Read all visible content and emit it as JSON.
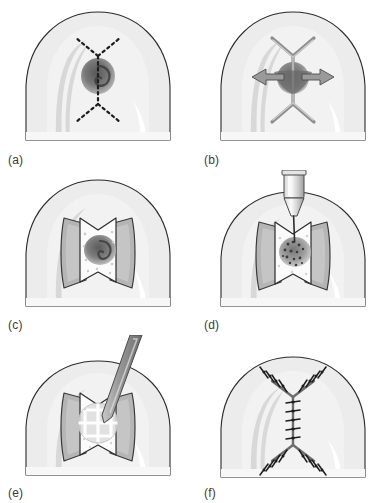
{
  "figure": {
    "type": "surgical-procedure-illustration",
    "style": "grayscale line drawing",
    "background_color": "#ffffff",
    "columns": 2,
    "rows": 3,
    "panel_count": 6
  },
  "palette": {
    "outline": "#2b2b2b",
    "skin_base": "#ececec",
    "skin_light": "#f4f4f4",
    "skin_mid": "#e0e0e0",
    "skin_shadow": "#d2d2d2",
    "highlight": "#ffffff",
    "lesion_dark": "#6e6e6e",
    "lesion_core": "#4a4a4a",
    "flap_underside": "#b9b9b9",
    "flap_face": "#fbfbfb",
    "instrument_light": "#e6e6e6",
    "instrument_mid": "#bdbdbd",
    "instrument_dark": "#8a8a8a",
    "suture": "#1d1d1d",
    "label_text": "#3a3a3a"
  },
  "panels": [
    {
      "id": "a",
      "label": "(a)",
      "caption_text": "(a)",
      "stage": "planned-incision",
      "description": "Dome shaped anatomical structure with a pigmented lesion at center and a dashed double-Y (lazy-H) incision marked over it",
      "markings": {
        "incision_style": "dashed",
        "incision_pattern": "double-Y",
        "lesion_visible": true,
        "instrument": "none"
      }
    },
    {
      "id": "b",
      "label": "(b)",
      "caption_text": "(b)",
      "stage": "incision-made-and-undermining",
      "description": "The double-Y incision has been cut and bidirectional arrows show lateral undermining of the tissue",
      "markings": {
        "incision_style": "solid-cut",
        "incision_pattern": "double-Y",
        "lesion_visible": true,
        "instrument": "arrows",
        "arrow_count": 2,
        "arrow_direction": "bidirectional-lateral"
      }
    },
    {
      "id": "c",
      "label": "(c)",
      "caption_text": "(c)",
      "stage": "flaps-retracted",
      "description": "Two triangular flaps are raised and retracted laterally exposing the lesion on the underlying surface",
      "markings": {
        "incision_style": "open",
        "incision_pattern": "double-Y",
        "lesion_visible": true,
        "instrument": "none",
        "flaps_raised": 2
      }
    },
    {
      "id": "d",
      "label": "(d)",
      "caption_text": "(d)",
      "stage": "injection-application",
      "description": "A syringe or applicator tip delivers a speckled agent onto the exposed lesion between the retracted flaps",
      "markings": {
        "incision_style": "open",
        "incision_pattern": "double-Y",
        "lesion_visible": true,
        "instrument": "syringe-applicator",
        "speckles": true
      }
    },
    {
      "id": "e",
      "label": "(e)",
      "caption_text": "(e)",
      "stage": "mesh-patch-placement",
      "description": "A flat spatula or probe positions a square grid mesh patch over the treated lesion within the open flaps",
      "markings": {
        "incision_style": "open",
        "incision_pattern": "double-Y",
        "lesion_visible": true,
        "instrument": "spatula-probe",
        "mesh_grid": "3x3"
      }
    },
    {
      "id": "f",
      "label": "(f)",
      "caption_text": "(f)",
      "stage": "closure",
      "description": "The flaps are repositioned and the double-Y incision is closed with interrupted sutures",
      "markings": {
        "incision_style": "sutured",
        "incision_pattern": "double-Y",
        "lesion_visible": false,
        "instrument": "none",
        "suture_type": "interrupted"
      }
    }
  ]
}
